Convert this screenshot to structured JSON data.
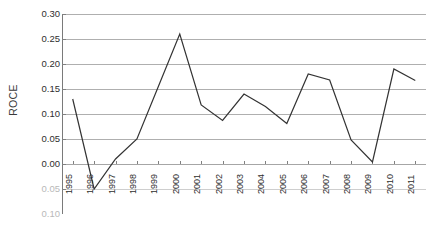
{
  "chart_data": {
    "type": "line",
    "title": "",
    "xlabel": "",
    "ylabel": "ROCE",
    "categories": [
      "1995",
      "1996",
      "1997",
      "1998",
      "1999",
      "2000",
      "2001",
      "2002",
      "2003",
      "2004",
      "2005",
      "2006",
      "2007",
      "2008",
      "2009",
      "2010",
      "2011"
    ],
    "values": [
      0.13,
      -0.05,
      0.01,
      0.05,
      0.155,
      0.26,
      0.118,
      0.087,
      0.14,
      0.115,
      0.081,
      0.18,
      0.168,
      0.048,
      0.004,
      0.19,
      0.167
    ],
    "series": [
      {
        "name": "ROCE",
        "values": [
          0.13,
          -0.05,
          0.01,
          0.05,
          0.155,
          0.26,
          0.118,
          0.087,
          0.14,
          0.115,
          0.081,
          0.18,
          0.168,
          0.048,
          0.004,
          0.19,
          0.167
        ]
      }
    ],
    "ylim": [
      -0.1,
      0.3
    ],
    "y_ticks": [
      0.3,
      0.25,
      0.2,
      0.15,
      0.1,
      0.05,
      0.0,
      -0.05,
      -0.1
    ],
    "y_tick_labels": [
      "0.30",
      "0.25",
      "0.20",
      "0.15",
      "0.10",
      "0.05",
      "0.00",
      "0.05",
      "0.10"
    ],
    "y_tick_labels_faded": [
      false,
      false,
      false,
      false,
      false,
      false,
      false,
      true,
      true
    ],
    "grid": true,
    "grid_color": "#a6a6a6",
    "axis_color": "#808080",
    "line_color": "#333333",
    "line_width": 1.2,
    "legend": false,
    "legend_position": "none",
    "markers": false,
    "plot_background": "#ffffff",
    "x_tick_rotation": -90,
    "annotations": []
  },
  "axis": {
    "y_title": "ROCE"
  }
}
